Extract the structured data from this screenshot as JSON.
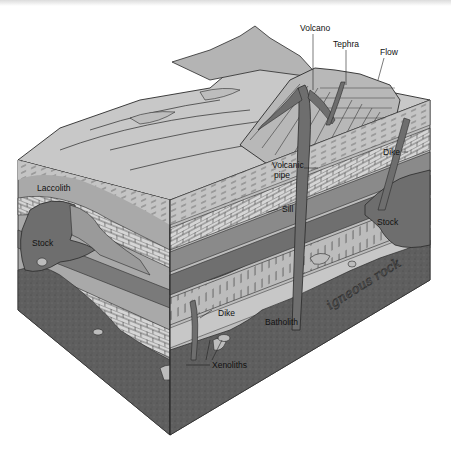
{
  "figure": {
    "handwritten_note": "igneous rock"
  },
  "labels": {
    "volcano": "Volcano",
    "tephra": "Tephra",
    "flow": "Flow",
    "dike_upper": "Dike",
    "volcanic_pipe_line1": "Volcanic",
    "volcanic_pipe_line2": "pipe",
    "laccolith": "Laccolith",
    "sill": "Sill",
    "stock_left": "Stock",
    "stock_right": "Stock",
    "dike_lower": "Dike",
    "batholith": "Batholith",
    "xenoliths": "Xenoliths"
  },
  "colors": {
    "surface": "#c8c8c8",
    "layer_light": "#bdbdbd",
    "layer_mid": "#a9a9a9",
    "layer_dark": "#7a7a7a",
    "intrusion": "#6e6e6e",
    "batholith": "#5f5f5f",
    "xenolith": "#b8b8b8",
    "outline": "#2a2a2a"
  }
}
